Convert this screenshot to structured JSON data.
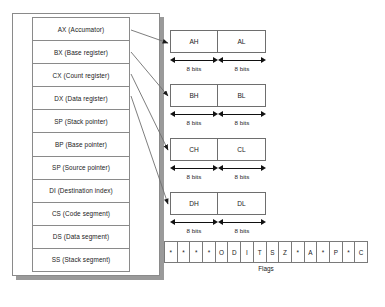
{
  "diagram": {
    "colors": {
      "line": "#8a8a8a",
      "arrow": "#1a1a1a",
      "shadow": "#9a9a9a",
      "text": "#1a1a1a",
      "background": "#ffffff"
    }
  },
  "registers": [
    {
      "label": "AX (Accumator)"
    },
    {
      "label": "BX (Base register)"
    },
    {
      "label": "CX (Count register)"
    },
    {
      "label": "DX (Data register)"
    },
    {
      "label": "SP (Stack pointer)"
    },
    {
      "label": "BP (Base pointer)"
    },
    {
      "label": "SP (Source pointer)"
    },
    {
      "label": "DI (Destination index)"
    },
    {
      "label": "CS (Code segment)"
    },
    {
      "label": "DS (Data segment)"
    },
    {
      "label": "SS (Stack segment)"
    }
  ],
  "splits": [
    {
      "high": "AH",
      "low": "AL",
      "high_bits": "8 bits",
      "low_bits": "8 bits",
      "source": "AX (Accumator)"
    },
    {
      "high": "BH",
      "low": "BL",
      "high_bits": "8 bits",
      "low_bits": "8 bits",
      "source": "BX (Base register)"
    },
    {
      "high": "CH",
      "low": "CL",
      "high_bits": "8 bits",
      "low_bits": "8 bits",
      "source": "CX (Count register)"
    },
    {
      "high": "DH",
      "low": "DL",
      "high_bits": "8 bits",
      "low_bits": "8 bits",
      "source": "DX (Data register)"
    }
  ],
  "flags": {
    "caption": "Flags",
    "cells": [
      "*",
      "*",
      "*",
      "*",
      "O",
      "D",
      "I",
      "T",
      "S",
      "Z",
      "*",
      "A",
      "*",
      "P",
      "*",
      "C"
    ]
  }
}
